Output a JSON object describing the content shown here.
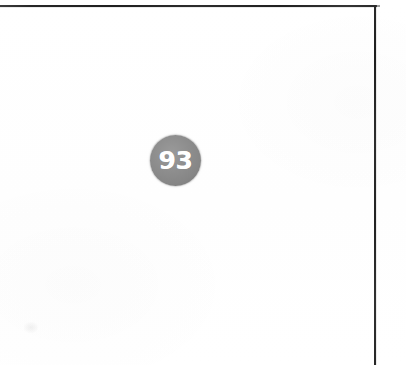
{
  "page": {
    "width": 406,
    "height": 365,
    "background_color": "#ffffff"
  },
  "frame": {
    "ink_color": "#2b2b2b",
    "top_rule": {
      "name": "top-border-rule",
      "x": 0,
      "y": 5,
      "length": 377,
      "thickness": 2,
      "orientation": "horizontal"
    },
    "right_rule": {
      "name": "right-border-rule",
      "x": 374,
      "y": 5,
      "length": 360,
      "thickness": 2,
      "orientation": "vertical"
    }
  },
  "badge": {
    "name": "score-badge",
    "value": "93",
    "shape": "circle",
    "fill_color": "#8a8a8a",
    "text_color": "#ffffff",
    "diameter": 51,
    "center_x": 175,
    "center_y": 160
  },
  "artifacts": {
    "scan_speck_label": ""
  }
}
